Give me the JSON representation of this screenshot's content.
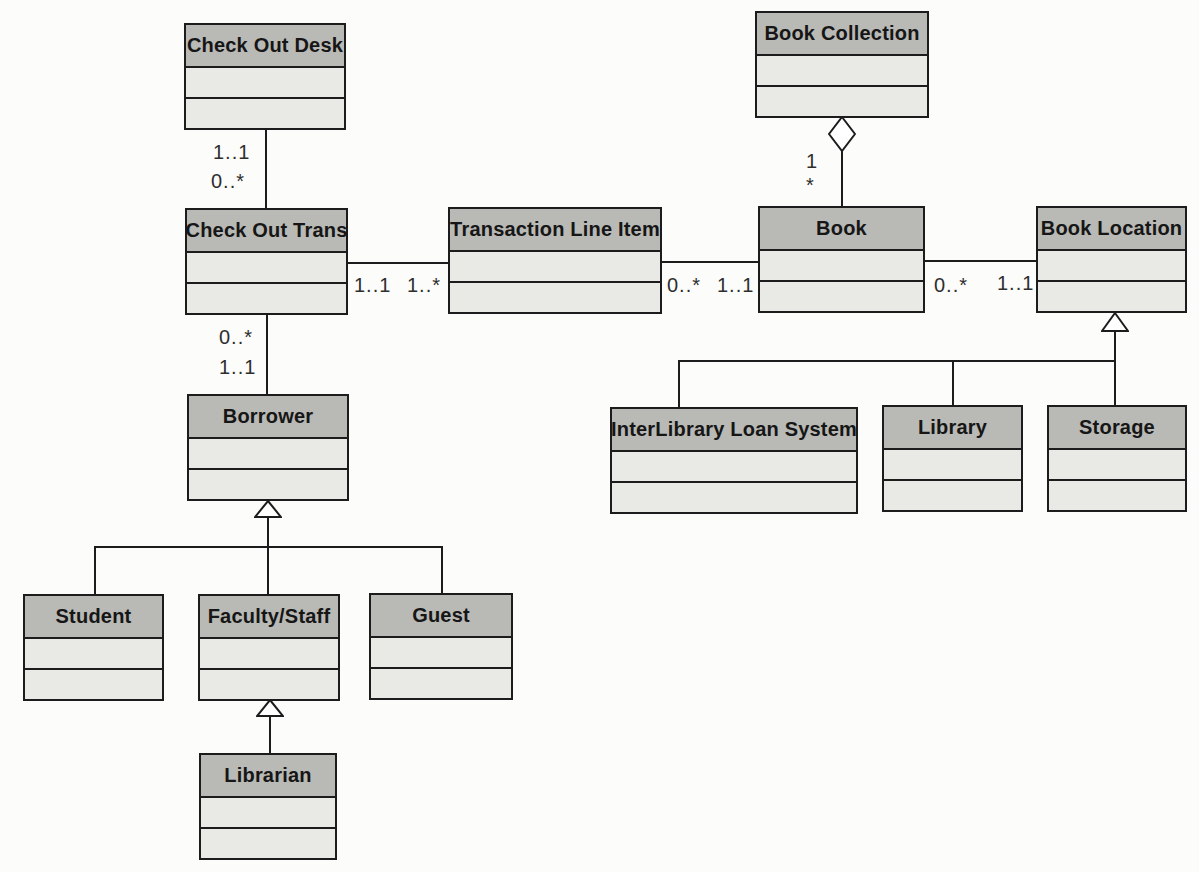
{
  "diagram": {
    "type": "uml-class-diagram",
    "classes": [
      {
        "id": "check-out-desk",
        "name": "Check Out Desk"
      },
      {
        "id": "check-out-trans",
        "name": "Check Out Trans"
      },
      {
        "id": "transaction-line-item",
        "name": "Transaction Line Item"
      },
      {
        "id": "book-collection",
        "name": "Book Collection"
      },
      {
        "id": "book",
        "name": "Book"
      },
      {
        "id": "book-location",
        "name": "Book Location"
      },
      {
        "id": "borrower",
        "name": "Borrower"
      },
      {
        "id": "interlibrary-loan-system",
        "name": "InterLibrary Loan System"
      },
      {
        "id": "library",
        "name": "Library"
      },
      {
        "id": "storage",
        "name": "Storage"
      },
      {
        "id": "student",
        "name": "Student"
      },
      {
        "id": "faculty-staff",
        "name": "Faculty/Staff"
      },
      {
        "id": "guest",
        "name": "Guest"
      },
      {
        "id": "librarian",
        "name": "Librarian"
      }
    ],
    "multiplicities": {
      "desk_trans_upper": "1..1",
      "desk_trans_lower": "0..*",
      "trans_borrower_upper": "0..*",
      "trans_borrower_lower": "1..1",
      "trans_line_left": "1..1",
      "trans_line_right": "1..*",
      "line_book_left": "0..*",
      "line_book_right": "1..1",
      "book_location_left": "0..*",
      "book_location_right": "1..1",
      "collection_book_upper": "1",
      "collection_book_lower": "*"
    },
    "relationships": [
      {
        "type": "association",
        "from": "Check Out Desk",
        "to": "Check Out Trans",
        "from_mult": "1..1",
        "to_mult": "0..*"
      },
      {
        "type": "association",
        "from": "Check Out Trans",
        "to": "Transaction Line Item",
        "from_mult": "1..1",
        "to_mult": "1..*"
      },
      {
        "type": "association",
        "from": "Transaction Line Item",
        "to": "Book",
        "from_mult": "0..*",
        "to_mult": "1..1"
      },
      {
        "type": "association",
        "from": "Book",
        "to": "Book Location",
        "from_mult": "0..*",
        "to_mult": "1..1"
      },
      {
        "type": "association",
        "from": "Check Out Trans",
        "to": "Borrower",
        "from_mult": "0..*",
        "to_mult": "1..1"
      },
      {
        "type": "aggregation",
        "whole": "Book Collection",
        "part": "Book",
        "whole_mult": "1",
        "part_mult": "*"
      },
      {
        "type": "generalization",
        "parent": "Borrower",
        "children": [
          "Student",
          "Faculty/Staff",
          "Guest"
        ]
      },
      {
        "type": "generalization",
        "parent": "Faculty/Staff",
        "children": [
          "Librarian"
        ]
      },
      {
        "type": "generalization",
        "parent": "Book Location",
        "children": [
          "InterLibrary Loan System",
          "Library",
          "Storage"
        ]
      }
    ],
    "colors": {
      "title_fill": "#b9b9b5",
      "body_fill": "#e9e9e5",
      "border": "#1c1c1c",
      "background": "#fcfcfa"
    }
  }
}
